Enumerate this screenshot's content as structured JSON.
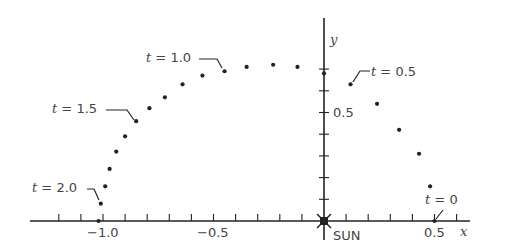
{
  "chart_data": {
    "type": "scatter",
    "title": "",
    "xlabel": "x",
    "ylabel": "y",
    "origin_label": "SUN",
    "xlim": [
      -1.1,
      0.6
    ],
    "ylim": [
      0,
      0.75
    ],
    "x_ticks": [
      -1.0,
      -0.5,
      0.5
    ],
    "x_tick_labels": [
      "−1.0",
      "−0.5",
      "0.5"
    ],
    "x_minor_step": 0.1,
    "y_ticks": [
      0.5
    ],
    "y_tick_labels": [
      "0.5"
    ],
    "y_minor_step": 0.1,
    "grid": false,
    "series": [
      {
        "name": "orbit",
        "t": [
          0.0,
          0.1,
          0.2,
          0.3,
          0.4,
          0.5,
          0.6,
          0.7,
          0.8,
          0.9,
          1.0,
          1.1,
          1.2,
          1.3,
          1.4,
          1.5,
          1.6,
          1.7,
          1.8,
          1.9,
          2.0,
          2.1
        ],
        "x": [
          0.5,
          0.48,
          0.43,
          0.34,
          0.24,
          0.12,
          0.0,
          -0.12,
          -0.23,
          -0.35,
          -0.45,
          -0.55,
          -0.64,
          -0.72,
          -0.79,
          -0.85,
          -0.9,
          -0.94,
          -0.97,
          -0.99,
          -1.01,
          -1.02
        ],
        "y": [
          0.0,
          0.16,
          0.31,
          0.42,
          0.54,
          0.63,
          0.68,
          0.71,
          0.72,
          0.71,
          0.69,
          0.67,
          0.63,
          0.57,
          0.52,
          0.46,
          0.39,
          0.32,
          0.24,
          0.16,
          0.08,
          0.0
        ]
      }
    ],
    "annotations": [
      {
        "text": "t = 0",
        "t": 0.0
      },
      {
        "text": "t = 0.5",
        "t": 0.5
      },
      {
        "text": "t = 1.0",
        "t": 1.0
      },
      {
        "text": "t = 1.5",
        "t": 1.5
      },
      {
        "text": "t = 2.0",
        "t": 2.0
      }
    ]
  },
  "labels": {
    "t0": "t = 0",
    "t05": "t = 0.5",
    "t10": "t = 1.0",
    "t15": "t = 1.5",
    "t20": "t = 2.0",
    "x_axis": "x",
    "y_axis": "y",
    "sun": "SUN",
    "xtick_m1": "−1.0",
    "xtick_m05": "−0.5",
    "xtick_05": "0.5",
    "ytick_05": "0.5"
  },
  "colors": {
    "ink": "#222222",
    "text": "#444444"
  }
}
